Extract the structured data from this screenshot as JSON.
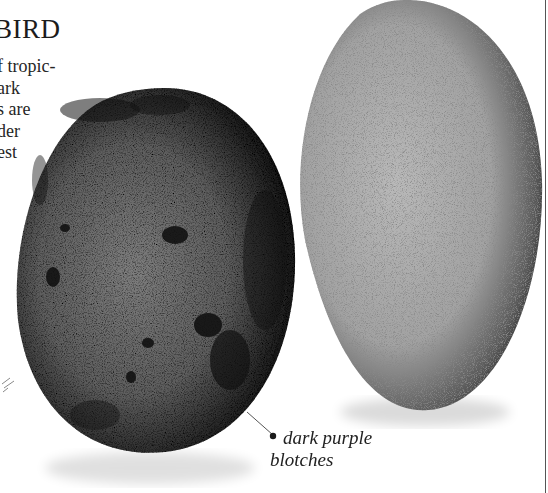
{
  "page": {
    "heading": "BIRD",
    "body_lines": [
      "f tropic-",
      "ark",
      "s are",
      "der",
      "est"
    ]
  },
  "illustrations": {
    "left_egg": {
      "description": "dark speckled egg with purple blotches",
      "base_color": "#3a3a3a",
      "highlight_color": "#7a7a7a"
    },
    "right_egg": {
      "description": "pale grey finely speckled egg",
      "base_color": "#9c9c9c",
      "highlight_color": "#b8b8b8"
    }
  },
  "caption": {
    "line1": "dark purple",
    "line2": "blotches"
  }
}
